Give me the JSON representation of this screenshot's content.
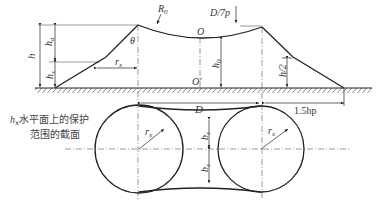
{
  "diagram": {
    "type": "lightning-protection-zone double-mast",
    "labels": {
      "R0": "R",
      "R0_sub": "0",
      "D7p": "D/7p",
      "O": "O",
      "O_prime": "O'",
      "theta": "θ",
      "h": "h",
      "ha": "h",
      "ha_sub": "a",
      "hx": "h",
      "hx_sub": "x",
      "rx": "r",
      "rx_sub": "x",
      "h0": "h",
      "h0_sub": "0",
      "h2": "h/2",
      "D": "D",
      "hp15": "1.5hp",
      "bx": "b",
      "bx_sub": "x",
      "rx_circle_left": "r",
      "rx_circle_right": "r",
      "caption_line1_h": "h",
      "caption_line1_sub": "x",
      "caption_line1": "水平面上的保护",
      "caption_line2": "范围的截面"
    },
    "colors": {
      "line": "#222222",
      "dim": "#444444",
      "background": "#ffffff"
    }
  }
}
